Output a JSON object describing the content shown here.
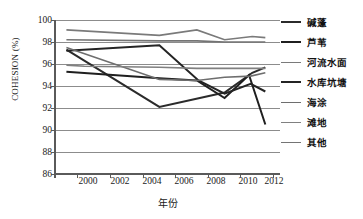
{
  "chart_data": {
    "type": "line",
    "title": "",
    "xlabel": "年份",
    "ylabel": "COHESION (%)",
    "xlim": [
      1998.6,
      2012.4
    ],
    "ylim": [
      86,
      100
    ],
    "xticks": [
      2000,
      2002,
      2004,
      2006,
      2008,
      2010,
      2012
    ],
    "yticks": [
      86,
      88,
      90,
      92,
      94,
      96,
      98,
      100
    ],
    "grid": "horizontal",
    "legend_position": "right",
    "series": [
      {
        "name": "碱蓬",
        "color": "#2b2b2b",
        "width": 2.0,
        "x": [
          1999.3,
          2005.0,
          2009.0,
          2010.7,
          2011.5
        ],
        "values": [
          97.3,
          92.1,
          93.4,
          95.2,
          95.7
        ]
      },
      {
        "name": "芦苇",
        "color": "#1f1f1f",
        "width": 2.0,
        "x": [
          1999.3,
          2005.0,
          2007.3,
          2009.0,
          2010.5,
          2011.5
        ],
        "values": [
          95.3,
          94.7,
          94.5,
          92.9,
          95.0,
          90.5
        ]
      },
      {
        "name": "河流水面",
        "color": "#7a7a7a",
        "width": 1.6,
        "x": [
          1999.3,
          2005.0,
          2007.3,
          2009.0,
          2010.7,
          2011.5
        ],
        "values": [
          99.1,
          98.6,
          99.1,
          98.2,
          98.5,
          98.4
        ]
      },
      {
        "name": "水库坑塘",
        "color": "#242424",
        "width": 2.0,
        "x": [
          1999.3,
          2005.0,
          2007.4,
          2009.0,
          2010.6,
          2011.5
        ],
        "values": [
          97.2,
          97.7,
          94.5,
          93.3,
          94.2,
          93.5
        ]
      },
      {
        "name": "海涂",
        "color": "#6e6e6e",
        "width": 1.6,
        "x": [
          1999.3,
          2005.0,
          2007.3,
          2009.0,
          2010.6,
          2011.5
        ],
        "values": [
          97.5,
          94.6,
          94.5,
          94.8,
          94.9,
          95.2
        ]
      },
      {
        "name": "滩地",
        "color": "#808080",
        "width": 1.6,
        "x": [
          1999.3,
          2000.4,
          2005.0,
          2007.3,
          2009.0,
          2011.5
        ],
        "values": [
          95.9,
          95.8,
          95.7,
          95.6,
          95.6,
          95.6
        ]
      },
      {
        "name": "其他",
        "color": "#747474",
        "width": 1.6,
        "x": [
          1999.3,
          2005.0,
          2007.3,
          2009.0,
          2010.7,
          2011.5
        ],
        "values": [
          98.2,
          98.1,
          98.1,
          98.0,
          98.0,
          98.0
        ]
      }
    ]
  },
  "axes": {
    "ylabel": "COHESION (%)",
    "xlabel": "年份",
    "ytick_labels": [
      "100",
      "98",
      "96",
      "94",
      "92",
      "90",
      "88",
      "86"
    ],
    "xtick_labels": [
      "2000",
      "2002",
      "2004",
      "2006",
      "2008",
      "2010",
      "2012"
    ]
  },
  "legend": {
    "items": [
      {
        "label": "碱蓬"
      },
      {
        "label": "芦苇"
      },
      {
        "label": "河流水面"
      },
      {
        "label": "水库坑塘"
      },
      {
        "label": "海涂"
      },
      {
        "label": "滩地"
      },
      {
        "label": "其他"
      }
    ]
  },
  "colors": {
    "gridline": "#8c8c8c",
    "axis": "#5a5a5a",
    "text": "#1a1a1a",
    "background": "#ffffff"
  }
}
